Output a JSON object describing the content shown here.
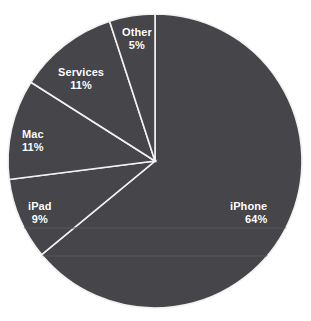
{
  "chart_data": {
    "type": "pie",
    "title": "",
    "subtitle": "",
    "legend_position": "none",
    "grid": true,
    "start_angle_deg": 0,
    "direction": "clockwise",
    "categories": [
      "iPhone",
      "iPad",
      "Mac",
      "Services",
      "Other"
    ],
    "values": [
      64,
      9,
      11,
      11,
      5
    ],
    "value_suffix": "%",
    "labels": [
      {
        "name": "iPhone",
        "value": 64,
        "value_text": "64%",
        "align": "right",
        "left": 230,
        "top": 200
      },
      {
        "name": "iPad",
        "value": 9,
        "value_text": "9%",
        "align": "center",
        "left": 28,
        "top": 200
      },
      {
        "name": "Mac",
        "value": 11,
        "value_text": "11%",
        "align": "center",
        "left": 22,
        "top": 128
      },
      {
        "name": "Services",
        "value": 11,
        "value_text": "11%",
        "align": "center",
        "left": 58,
        "top": 66
      },
      {
        "name": "Other",
        "value": 5,
        "value_text": "5%",
        "align": "center",
        "left": 122,
        "top": 26
      }
    ],
    "colors": {
      "slice_fill": "#46464a",
      "slice_separator": "#f2f2f2",
      "label_text": "#ffffff",
      "background": "#ffffff",
      "gridline": "#57575b"
    },
    "geometry": {
      "center_x": 155,
      "center_y": 161,
      "radius": 147
    },
    "gridlines_y": [
      228,
      256
    ]
  }
}
